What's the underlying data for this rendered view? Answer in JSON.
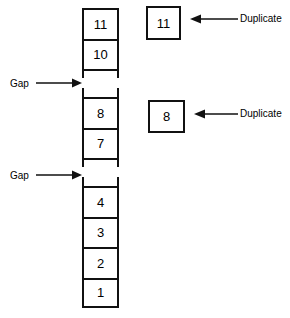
{
  "diagram": {
    "stroke_color": "#111111",
    "background_color": "#ffffff",
    "stack": {
      "name": "main-column",
      "cells": [
        {
          "value": "11",
          "type": "value"
        },
        {
          "value": "10",
          "type": "value"
        },
        {
          "value": "",
          "type": "gap"
        },
        {
          "value": "8",
          "type": "value"
        },
        {
          "value": "7",
          "type": "value"
        },
        {
          "value": "",
          "type": "gap"
        },
        {
          "value": "4",
          "type": "value"
        },
        {
          "value": "3",
          "type": "value"
        },
        {
          "value": "2",
          "type": "value"
        },
        {
          "value": "1",
          "type": "value"
        }
      ]
    },
    "duplicate_boxes": [
      {
        "value": "11",
        "label": "Duplicate"
      },
      {
        "value": "8",
        "label": "Duplicate"
      }
    ],
    "gap_annotations": [
      {
        "label": "Gap"
      },
      {
        "label": "Gap"
      }
    ]
  }
}
